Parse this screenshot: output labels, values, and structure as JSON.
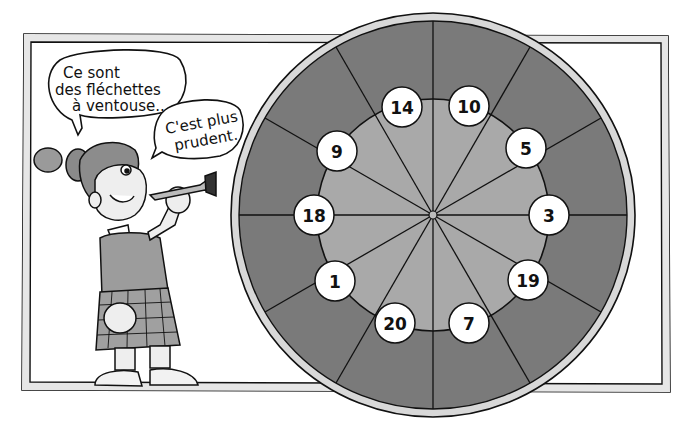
{
  "speech_bubbles": [
    {
      "id": "bubble-1",
      "lines": [
        "Ce sont",
        "des fléchettes",
        "à ventouse..."
      ]
    },
    {
      "id": "bubble-2",
      "lines": [
        "C'est plus",
        "prudent."
      ]
    }
  ],
  "dartboard": {
    "sectors": 12,
    "numbers_clockwise_from_top": [
      "10",
      "5",
      "3",
      "19",
      "7",
      "20",
      "1",
      "18",
      "9",
      "14"
    ],
    "number_positions": [
      {
        "label": "14",
        "x": 402,
        "y": 107
      },
      {
        "label": "10",
        "x": 469,
        "y": 106
      },
      {
        "label": "5",
        "x": 526,
        "y": 148
      },
      {
        "label": "3",
        "x": 549,
        "y": 215
      },
      {
        "label": "19",
        "x": 528,
        "y": 280
      },
      {
        "label": "7",
        "x": 469,
        "y": 323
      },
      {
        "label": "20",
        "x": 395,
        "y": 323
      },
      {
        "label": "1",
        "x": 335,
        "y": 281
      },
      {
        "label": "18",
        "x": 314,
        "y": 215
      },
      {
        "label": "9",
        "x": 337,
        "y": 151
      }
    ]
  },
  "colors": {
    "outer_ring": "#7a7a7a",
    "inner_disc": "#a9a9a9",
    "rim": "#d8d8d8",
    "line": "#111111",
    "frame_fill": "#e6e6e6"
  }
}
